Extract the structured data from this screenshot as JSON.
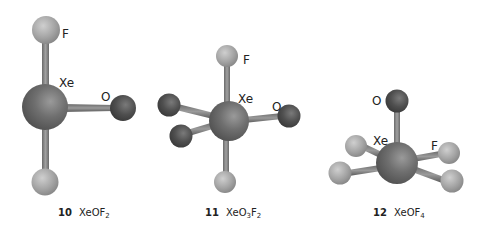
{
  "colors": {
    "xenon": "#6e6e6e",
    "oxygen": "#4e4e4e",
    "fluorine": "#a8a8a8",
    "bond": "#8a8a8a",
    "label": "#222222"
  },
  "molecules": [
    {
      "number": "10",
      "formula_base": "XeOF",
      "formula_sub": "2",
      "formula_display": "XeOF₂",
      "labels": {
        "f": "F",
        "xe": "Xe",
        "o": "O"
      }
    },
    {
      "number": "11",
      "formula_base_1": "XeO",
      "formula_sub_1": "3",
      "formula_base_2": "F",
      "formula_sub_2": "2",
      "formula_display": "XeO₃F₂",
      "labels": {
        "f": "F",
        "xe": "Xe",
        "o": "O"
      }
    },
    {
      "number": "12",
      "formula_base": "XeOF",
      "formula_sub": "4",
      "formula_display": "XeOF₄",
      "labels": {
        "f": "F",
        "xe": "Xe",
        "o": "O"
      }
    }
  ]
}
